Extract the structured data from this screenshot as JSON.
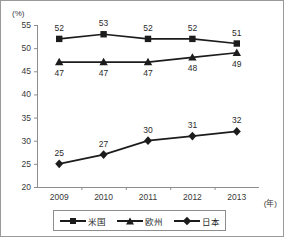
{
  "chart_data": {
    "type": "line",
    "title": "",
    "xlabel": "(年)",
    "ylabel": "(%)",
    "x": [
      "2009",
      "2010",
      "2011",
      "2012",
      "2013"
    ],
    "categories": [
      "2009",
      "2010",
      "2011",
      "2012",
      "2013"
    ],
    "ylim": [
      20,
      55
    ],
    "yticks": [
      20,
      25,
      30,
      35,
      40,
      45,
      50,
      55
    ],
    "ytick_labels": [
      "20",
      "25",
      "30",
      "35",
      "40",
      "45",
      "50",
      "55"
    ],
    "grid": false,
    "legend_position": "bottom",
    "series": [
      {
        "name": "米国",
        "marker": "square",
        "label_position": "above",
        "values": [
          52,
          53,
          52,
          52,
          51
        ],
        "value_labels": [
          "52",
          "53",
          "52",
          "52",
          "51"
        ]
      },
      {
        "name": "欧州",
        "marker": "triangle",
        "label_position": "below",
        "values": [
          47,
          47,
          47,
          48,
          49
        ],
        "value_labels": [
          "47",
          "47",
          "47",
          "48",
          "49"
        ]
      },
      {
        "name": "日本",
        "marker": "diamond",
        "label_position": "above",
        "values": [
          25,
          27,
          30,
          31,
          32
        ],
        "value_labels": [
          "25",
          "27",
          "30",
          "31",
          "32"
        ]
      }
    ],
    "colors": {
      "line": "#1c1c1c",
      "marker": "#1c1c1c",
      "axis": "#8d8d8d",
      "text": "#3a3a3a",
      "background": "#ffffff"
    }
  },
  "axis": {
    "y_unit": "(%)",
    "x_unit": "(年)"
  },
  "legend": {
    "entries": [
      {
        "label": "米国",
        "marker": "square"
      },
      {
        "label": "欧州",
        "marker": "triangle"
      },
      {
        "label": "日本",
        "marker": "diamond"
      }
    ]
  }
}
